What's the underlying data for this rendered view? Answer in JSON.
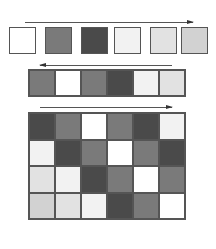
{
  "palette": {
    "white": "#ffffff",
    "very_light": "#f2f2f2",
    "light": "#e2e2e2",
    "light_dotted": "#d2d2d2",
    "mid": "#7a7a7a",
    "dark": "#4a4a4a"
  },
  "top_row": {
    "arrow_direction": "right",
    "boxes": [
      "white",
      "mid",
      "dark",
      "very_light",
      "light",
      "light_dotted"
    ]
  },
  "middle_strip": {
    "arrow_direction": "left",
    "cells": [
      "mid",
      "white",
      "mid",
      "dark",
      "very_light",
      "light"
    ]
  },
  "grid": {
    "arrow_direction": "right",
    "rows": [
      [
        "dark",
        "mid",
        "white",
        "mid",
        "dark",
        "very_light"
      ],
      [
        "very_light",
        "dark",
        "mid",
        "white",
        "mid",
        "dark"
      ],
      [
        "light",
        "very_light",
        "dark",
        "mid",
        "white",
        "mid"
      ],
      [
        "light_dotted",
        "light",
        "very_light",
        "dark",
        "mid",
        "white"
      ]
    ]
  }
}
